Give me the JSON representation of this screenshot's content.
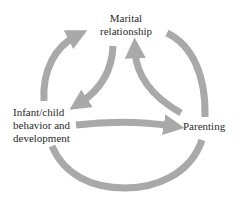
{
  "diagram": {
    "type": "cycle-relationship",
    "nodes": {
      "marital": {
        "lines": [
          "Marital",
          "relationship"
        ]
      },
      "infant": {
        "lines": [
          "Infant/child",
          "behavior and",
          "development"
        ]
      },
      "parenting": {
        "lines": [
          "Parenting"
        ]
      }
    },
    "edges": [
      {
        "from": "Infant/child behavior and development",
        "to": "Marital relationship",
        "style": "outer-arc-left"
      },
      {
        "from": "Marital relationship",
        "to": "Infant/child behavior and development",
        "style": "inner-curve"
      },
      {
        "from": "Parenting",
        "to": "Marital relationship",
        "style": "inner-curve"
      },
      {
        "from": "Infant/child behavior and development",
        "to": "Parenting",
        "style": "straight"
      },
      {
        "from": "Marital relationship",
        "to": "Parenting",
        "style": "outer-arc-right"
      },
      {
        "from": "Parenting",
        "to": "Infant/child behavior and development",
        "style": "outer-arc-bottom"
      }
    ],
    "colors": {
      "arrow": "#a9a9a9",
      "text": "#2a2a2a",
      "background": "#ffffff"
    }
  }
}
